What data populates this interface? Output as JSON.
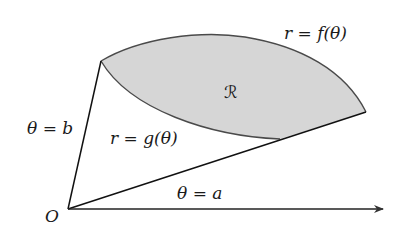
{
  "diagram": {
    "type": "polar-region",
    "colors": {
      "region_fill": "#d6d6d6",
      "curve_stroke": "#4a4a4a",
      "ray_stroke": "#111111",
      "text": "#1a1a1a"
    },
    "labels": {
      "outer_curve": "r = f(θ)",
      "inner_curve": "r = g(θ)",
      "region": "ℛ",
      "upper_ray": "θ = b",
      "lower_ray": "θ = a",
      "origin": "O"
    }
  }
}
